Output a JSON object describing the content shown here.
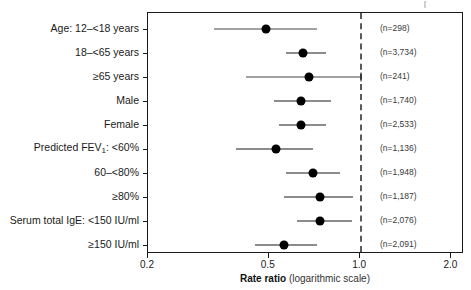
{
  "chart_data": {
    "type": "forest",
    "title": "",
    "xlabel_bold": "Rate ratio",
    "xlabel_light": "(logarithmic scale)",
    "ylabel": "",
    "scale": "log10",
    "xlim": [
      0.2,
      2.2
    ],
    "xticks": [
      0.2,
      0.5,
      1.0,
      2.0
    ],
    "xtick_labels": [
      "0.2",
      "0.5",
      "1.0",
      "2.0"
    ],
    "reference_line": 1.0,
    "grid": false,
    "legend": null,
    "n_column_header": "",
    "rows": [
      {
        "label": "Age: 12–<18 years",
        "label_plain": "Age: 12-<18 years",
        "n_text": "(n=298)",
        "n": 298,
        "estimate": 0.49,
        "ci_low": 0.33,
        "ci_high": 0.72,
        "ci_truncated_high": false
      },
      {
        "label": "18–<65 years",
        "label_plain": "18-<65 years",
        "n_text": "(n=3,734)",
        "n": 3734,
        "estimate": 0.65,
        "ci_low": 0.57,
        "ci_high": 0.77,
        "ci_truncated_high": false
      },
      {
        "label": "≥65 years",
        "label_plain": ">=65 years",
        "n_text": "(n=241)",
        "n": 241,
        "estimate": 0.68,
        "ci_low": 0.42,
        "ci_high": 1.01,
        "ci_truncated_high": true
      },
      {
        "label": "Male",
        "label_plain": "Male",
        "n_text": "(n=1,740)",
        "n": 1740,
        "estimate": 0.64,
        "ci_low": 0.52,
        "ci_high": 0.8,
        "ci_truncated_high": false
      },
      {
        "label": "Female",
        "label_plain": "Female",
        "n_text": "(n=2,533)",
        "n": 2533,
        "estimate": 0.64,
        "ci_low": 0.54,
        "ci_high": 0.77,
        "ci_truncated_high": false
      },
      {
        "label": "Predicted FEV₁: <60%",
        "label_plain": "Predicted FEV1: <60%",
        "label_prefix": "Predicted FEV",
        "label_sub": "1",
        "label_suffix": ": <60%",
        "n_text": "(n=1,136)",
        "n": 1136,
        "estimate": 0.53,
        "ci_low": 0.39,
        "ci_high": 0.7,
        "ci_truncated_high": false
      },
      {
        "label": "60–<80%",
        "label_plain": "60-<80%",
        "n_text": "(n=1,948)",
        "n": 1948,
        "estimate": 0.7,
        "ci_low": 0.57,
        "ci_high": 0.86,
        "ci_truncated_high": false
      },
      {
        "label": "≥80%",
        "label_plain": ">=80%",
        "n_text": "(n=1,187)",
        "n": 1187,
        "estimate": 0.74,
        "ci_low": 0.56,
        "ci_high": 0.95,
        "ci_truncated_high": false
      },
      {
        "label": "Serum total IgE: <150 IU/ml",
        "label_plain": "Serum total IgE: <150 IU/ml",
        "n_text": "(n=2,076)",
        "n": 2076,
        "estimate": 0.74,
        "ci_low": 0.62,
        "ci_high": 0.94,
        "ci_truncated_high": false
      },
      {
        "label": "≥150 IU/ml",
        "label_plain": ">=150 IU/ml",
        "n_text": "(n=2,091)",
        "n": 2091,
        "estimate": 0.56,
        "ci_low": 0.45,
        "ci_high": 0.72,
        "ci_truncated_high": false
      }
    ]
  },
  "colors": {
    "axis": "#1a1a1a",
    "marker": "#000000",
    "ci": "#1a1a1a",
    "reference": "#5a5a5a",
    "n_text": "#3a3a3a",
    "background": "#ffffff"
  }
}
